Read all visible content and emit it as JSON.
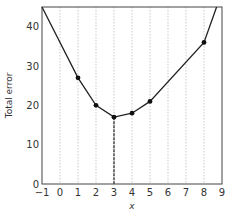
{
  "chart_data": {
    "type": "line",
    "title": "",
    "xlabel": "x",
    "ylabel": "Total error",
    "xlim": [
      -1,
      9
    ],
    "ylim": [
      0,
      45
    ],
    "x_ticks": [
      -1,
      0,
      1,
      2,
      3,
      4,
      5,
      6,
      7,
      8,
      9
    ],
    "y_ticks": [
      0,
      10,
      20,
      30,
      40
    ],
    "grid": "vertical dotted lines at integer x",
    "series": [
      {
        "name": "Total error",
        "points": [
          {
            "x": 1,
            "y": 27
          },
          {
            "x": 2,
            "y": 20
          },
          {
            "x": 3,
            "y": 17
          },
          {
            "x": 4,
            "y": 18
          },
          {
            "x": 5,
            "y": 21
          },
          {
            "x": 8,
            "y": 36
          }
        ],
        "curve": [
          {
            "x": -1,
            "y": 45
          },
          {
            "x": 1,
            "y": 27
          },
          {
            "x": 2,
            "y": 20
          },
          {
            "x": 3,
            "y": 17
          },
          {
            "x": 4,
            "y": 18
          },
          {
            "x": 5,
            "y": 21
          },
          {
            "x": 8,
            "y": 36
          },
          {
            "x": 8.7,
            "y": 45
          }
        ]
      }
    ],
    "annotations": [
      {
        "type": "dashed-vertical-line",
        "x": 3,
        "from_y": 0,
        "to_y": 17,
        "label": "minimum"
      }
    ]
  }
}
